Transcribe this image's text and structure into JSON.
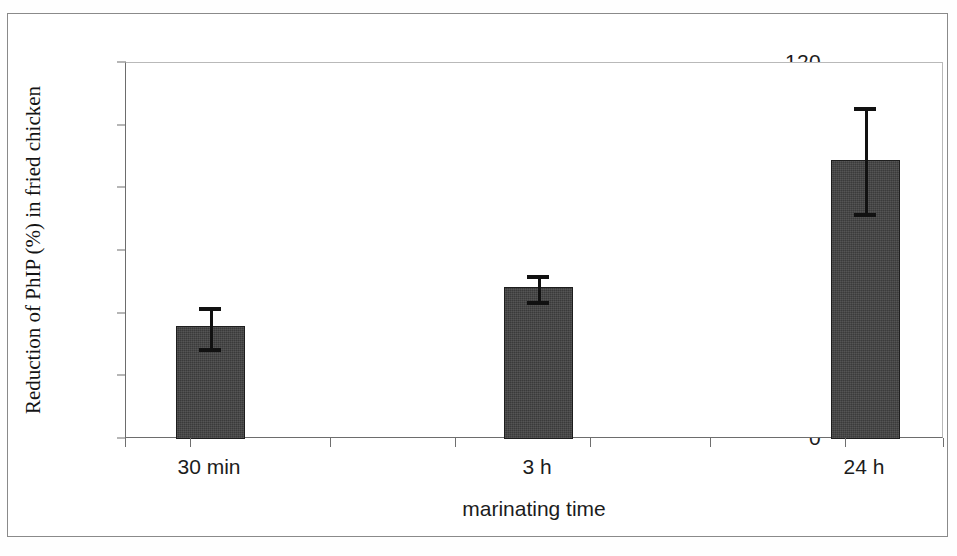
{
  "chart_data": {
    "type": "bar",
    "title": "",
    "xlabel": "marinating time",
    "ylabel": "Reduction of PhIP (%) in fried chicken",
    "categories": [
      "30 min",
      "3 h",
      "24 h"
    ],
    "values": [
      36,
      48.5,
      89
    ],
    "errors_upper": [
      6,
      4,
      17
    ],
    "errors_lower": [
      7,
      4.5,
      17
    ],
    "error_upper_values": [
      42,
      52.5,
      106
    ],
    "error_lower_values": [
      29,
      44,
      72
    ],
    "ylim": [
      0,
      120
    ],
    "yticks": [
      0,
      20,
      40,
      60,
      80,
      100,
      120
    ],
    "ytick_labels": [
      "0",
      "20",
      "40",
      "60",
      "80",
      "100",
      "120"
    ],
    "grid": false,
    "legend": null,
    "bar_color": "#414141",
    "bar_edge_color": "#1e1e1e",
    "error_color": "#111111"
  },
  "axis": {
    "y_title": "Reduction of PhIP (%) in fried chicken",
    "x_title": "marinating time"
  }
}
